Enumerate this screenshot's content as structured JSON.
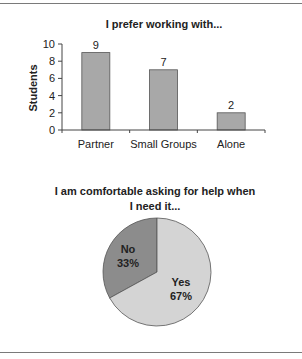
{
  "chart_data": [
    {
      "type": "bar",
      "title": "I prefer working with...",
      "xlabel": "",
      "ylabel": "Students",
      "ylim": [
        0,
        10
      ],
      "yticks": [
        "0",
        "2",
        "4",
        "6",
        "8",
        "10"
      ],
      "categories": [
        "Partner",
        "Small Groups",
        "Alone"
      ],
      "values": [
        9,
        7,
        2
      ],
      "data_labels": [
        "9",
        "7",
        "2"
      ],
      "bar_color": "#a8a8a8",
      "grid": false,
      "legend": "none"
    },
    {
      "type": "pie",
      "title_lines": [
        "I am comfortable asking for help when",
        "I need it..."
      ],
      "title": "I am comfortable asking for help when I need it...",
      "categories": [
        "No",
        "Yes"
      ],
      "values": [
        33,
        67
      ],
      "labels": [
        {
          "name": "No",
          "percent": "33%"
        },
        {
          "name": "Yes",
          "percent": "67%"
        }
      ],
      "colors": [
        "#8c8c8c",
        "#d4d4d4"
      ],
      "legend": "none"
    }
  ]
}
